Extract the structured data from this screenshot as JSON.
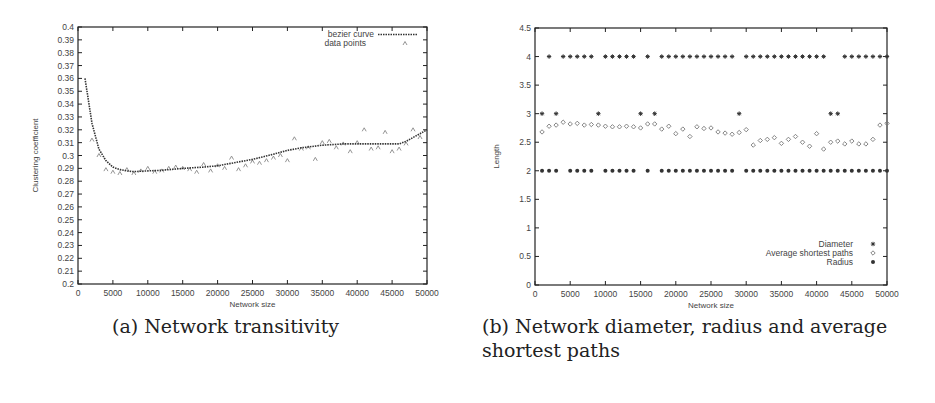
{
  "panels": {
    "a": {
      "caption": "(a) Network transitivity"
    },
    "b": {
      "caption": "(b) Network diameter, radius and average shortest paths"
    }
  },
  "chart_data": [
    {
      "id": "network-transitivity",
      "type": "line",
      "title": "",
      "caption": "(a) Network transitivity",
      "xlabel": "Network size",
      "ylabel": "Clustering coefficient",
      "xlim": [
        0,
        50000
      ],
      "ylim": [
        0.2,
        0.4
      ],
      "xticks": [
        0,
        5000,
        10000,
        15000,
        20000,
        25000,
        30000,
        35000,
        40000,
        45000,
        50000
      ],
      "yticks": [
        0.2,
        0.21,
        0.22,
        0.23,
        0.24,
        0.25,
        0.26,
        0.27,
        0.28,
        0.29,
        0.3,
        0.31,
        0.32,
        0.33,
        0.34,
        0.35,
        0.36,
        0.37,
        0.38,
        0.39,
        0.4
      ],
      "grid": false,
      "legend_position": "top-right",
      "series": [
        {
          "name": "bezier curve",
          "style": "dotted-line",
          "x": [
            1000,
            2000,
            3000,
            4000,
            5000,
            6000,
            7000,
            8000,
            10000,
            12000,
            15000,
            18000,
            20000,
            22000,
            25000,
            28000,
            30000,
            32000,
            35000,
            38000,
            40000,
            42000,
            44000,
            46000,
            47000,
            48000,
            49000,
            50000
          ],
          "y": [
            0.36,
            0.325,
            0.305,
            0.296,
            0.291,
            0.289,
            0.288,
            0.2875,
            0.288,
            0.2885,
            0.29,
            0.291,
            0.292,
            0.294,
            0.297,
            0.301,
            0.304,
            0.306,
            0.308,
            0.309,
            0.309,
            0.309,
            0.309,
            0.309,
            0.311,
            0.314,
            0.317,
            0.32
          ]
        },
        {
          "name": "data points",
          "style": "markers",
          "x": [
            2000,
            3000,
            4000,
            5000,
            6000,
            7000,
            8000,
            9000,
            10000,
            11000,
            12000,
            13000,
            14000,
            15000,
            16000,
            17000,
            18000,
            19000,
            20000,
            21000,
            22000,
            23000,
            24000,
            25000,
            26000,
            27000,
            28000,
            29000,
            30000,
            31000,
            32000,
            33000,
            34000,
            35000,
            36000,
            37000,
            38000,
            39000,
            40000,
            41000,
            42000,
            43000,
            44000,
            45000,
            46000,
            47000,
            48000,
            49000
          ],
          "y": [
            0.312,
            0.3,
            0.289,
            0.287,
            0.286,
            0.289,
            0.286,
            0.288,
            0.29,
            0.287,
            0.288,
            0.29,
            0.291,
            0.29,
            0.289,
            0.287,
            0.293,
            0.288,
            0.292,
            0.29,
            0.298,
            0.289,
            0.292,
            0.295,
            0.294,
            0.296,
            0.298,
            0.3,
            0.296,
            0.313,
            0.305,
            0.306,
            0.297,
            0.31,
            0.311,
            0.306,
            0.309,
            0.303,
            0.31,
            0.32,
            0.305,
            0.306,
            0.318,
            0.303,
            0.305,
            0.309,
            0.32,
            0.314
          ]
        }
      ]
    },
    {
      "id": "network-diameter-radius-asp",
      "type": "scatter",
      "title": "",
      "caption": "(b) Network diameter, radius and average shortest paths",
      "xlabel": "Network size",
      "ylabel": "Length",
      "xlim": [
        0,
        50000
      ],
      "ylim": [
        0,
        4.5
      ],
      "xticks": [
        0,
        5000,
        10000,
        15000,
        20000,
        25000,
        30000,
        35000,
        40000,
        45000,
        50000
      ],
      "yticks": [
        0,
        0.5,
        1,
        1.5,
        2,
        2.5,
        3,
        3.5,
        4,
        4.5
      ],
      "grid": false,
      "legend_position": "bottom-right",
      "series": [
        {
          "name": "Diameter",
          "marker": "star",
          "x": [
            1000,
            2000,
            3000,
            4000,
            5000,
            6000,
            7000,
            8000,
            9000,
            10000,
            11000,
            12000,
            13000,
            14000,
            15000,
            16000,
            17000,
            18000,
            19000,
            20000,
            21000,
            22000,
            23000,
            24000,
            25000,
            26000,
            27000,
            28000,
            29000,
            30000,
            31000,
            32000,
            33000,
            34000,
            35000,
            36000,
            37000,
            38000,
            39000,
            40000,
            41000,
            42000,
            43000,
            44000,
            45000,
            46000,
            47000,
            48000,
            49000,
            50000
          ],
          "y": [
            3,
            4,
            3,
            4,
            4,
            4,
            4,
            4,
            3,
            4,
            4,
            4,
            4,
            4,
            3,
            4,
            3,
            4,
            4,
            4,
            4,
            4,
            4,
            4,
            4,
            4,
            4,
            4,
            3,
            4,
            4,
            4,
            4,
            4,
            4,
            4,
            4,
            4,
            4,
            4,
            4,
            3,
            3,
            4,
            4,
            4,
            4,
            4,
            4,
            4
          ]
        },
        {
          "name": "Average shortest paths",
          "marker": "diamond",
          "x": [
            1000,
            2000,
            3000,
            4000,
            5000,
            6000,
            7000,
            8000,
            9000,
            10000,
            11000,
            12000,
            13000,
            14000,
            15000,
            16000,
            17000,
            18000,
            19000,
            20000,
            21000,
            22000,
            23000,
            24000,
            25000,
            26000,
            27000,
            28000,
            29000,
            30000,
            31000,
            32000,
            33000,
            34000,
            35000,
            36000,
            37000,
            38000,
            39000,
            40000,
            41000,
            42000,
            43000,
            44000,
            45000,
            46000,
            47000,
            48000,
            49000,
            50000
          ],
          "y": [
            2.68,
            2.78,
            2.8,
            2.85,
            2.82,
            2.83,
            2.8,
            2.81,
            2.8,
            2.78,
            2.77,
            2.77,
            2.78,
            2.77,
            2.75,
            2.82,
            2.82,
            2.73,
            2.78,
            2.65,
            2.73,
            2.6,
            2.77,
            2.74,
            2.75,
            2.68,
            2.66,
            2.64,
            2.67,
            2.72,
            2.45,
            2.53,
            2.55,
            2.58,
            2.48,
            2.55,
            2.6,
            2.5,
            2.43,
            2.65,
            2.38,
            2.5,
            2.52,
            2.47,
            2.52,
            2.47,
            2.47,
            2.55,
            2.8,
            2.83
          ]
        },
        {
          "name": "Radius",
          "marker": "filled-circle",
          "x": [
            1000,
            2000,
            3000,
            5000,
            6000,
            7000,
            8000,
            10000,
            11000,
            12000,
            13000,
            14000,
            16000,
            18000,
            19000,
            20000,
            21000,
            22000,
            23000,
            24000,
            25000,
            26000,
            27000,
            28000,
            30000,
            31000,
            32000,
            33000,
            34000,
            35000,
            36000,
            37000,
            38000,
            39000,
            40000,
            41000,
            42000,
            43000,
            44000,
            45000,
            46000,
            47000,
            48000,
            49000,
            50000
          ],
          "y": [
            2,
            2,
            2,
            2,
            2,
            2,
            2,
            2,
            2,
            2,
            2,
            2,
            2,
            2,
            2,
            2,
            2,
            2,
            2,
            2,
            2,
            2,
            2,
            2,
            2,
            2,
            2,
            2,
            2,
            2,
            2,
            2,
            2,
            2,
            2,
            2,
            2,
            2,
            2,
            2,
            2,
            2,
            2,
            2,
            2
          ]
        }
      ]
    }
  ]
}
